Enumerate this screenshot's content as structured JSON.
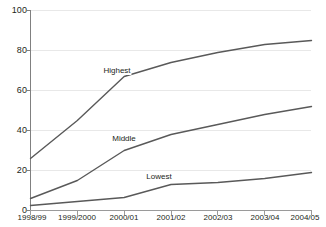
{
  "chart_data": {
    "type": "line",
    "title": "",
    "subtitle": "",
    "xlabel": "",
    "ylabel": "",
    "categories": [
      "1998/99",
      "1999/2000",
      "2000/01",
      "2001/02",
      "2002/03",
      "2003/04",
      "2004/05"
    ],
    "ylim": [
      0,
      100
    ],
    "yticks": [
      0,
      20,
      40,
      60,
      80,
      100
    ],
    "ytick_labels": [
      "0",
      "20",
      "40",
      "60",
      "80",
      "100"
    ],
    "grid": "horizontal",
    "legend_position": "inline-annotation",
    "series": [
      {
        "name": "Highest",
        "values": [
          26,
          45,
          67,
          74,
          79,
          83,
          85
        ],
        "color": "#595959",
        "label_x_index": 1.85,
        "label_y": 70
      },
      {
        "name": "Middle",
        "values": [
          6,
          15,
          30,
          38,
          43,
          48,
          52
        ],
        "color": "#595959",
        "label_x_index": 2.0,
        "label_y": 36
      },
      {
        "name": "Lowest",
        "values": [
          2.5,
          4.5,
          6.5,
          13,
          14,
          16,
          19
        ],
        "color": "#595959",
        "label_x_index": 2.75,
        "label_y": 17
      }
    ],
    "axis_color": "#808080",
    "grid_color": "#e8e8e8",
    "background": "#ffffff"
  }
}
